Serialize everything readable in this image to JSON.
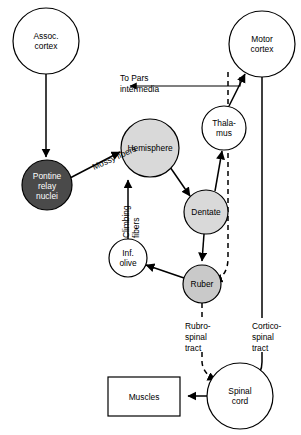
{
  "diagram": {
    "colors": {
      "white": "#ffffff",
      "light_gray": "#d9d9d9",
      "mid_gray": "#c9c9c9",
      "dark_gray": "#4a4a4a",
      "stroke": "#000000"
    },
    "nodes": [
      {
        "id": "assoc_cortex",
        "shape": "circle",
        "label": "Assoc.\ncortex",
        "lines": [
          "Assoc.",
          "cortex"
        ],
        "cx": 46,
        "cy": 41,
        "r": 33,
        "fill": "#ffffff",
        "text": "dark"
      },
      {
        "id": "motor_cortex",
        "shape": "circle",
        "label": "Motor\ncortex",
        "lines": [
          "Motor",
          "cortex"
        ],
        "cx": 262,
        "cy": 44,
        "r": 33,
        "fill": "#ffffff",
        "text": "dark"
      },
      {
        "id": "pontine",
        "shape": "circle",
        "label": "Pontine\nrelay\nnuclei",
        "lines": [
          "Pontine",
          "relay",
          "nuclei"
        ],
        "cx": 47,
        "cy": 185,
        "r": 25,
        "fill": "#4a4a4a",
        "text": "light"
      },
      {
        "id": "hemisphere",
        "shape": "circle",
        "label": "Hemisphere",
        "lines": [
          "Hemisphere"
        ],
        "cx": 150,
        "cy": 148,
        "r": 29,
        "fill": "#d9d9d9",
        "text": "dark"
      },
      {
        "id": "thalamus",
        "shape": "circle",
        "label": "Thala-\nmus",
        "lines": [
          "Thala-",
          "mus"
        ],
        "cx": 224,
        "cy": 128,
        "r": 22,
        "fill": "#ffffff",
        "text": "dark"
      },
      {
        "id": "dentate",
        "shape": "circle",
        "label": "Dentate",
        "lines": [
          "Dentate"
        ],
        "cx": 206,
        "cy": 212,
        "r": 22,
        "fill": "#d9d9d9",
        "text": "dark"
      },
      {
        "id": "inf_olive",
        "shape": "circle",
        "label": "Inf.\nolive",
        "lines": [
          "Inf.",
          "olive"
        ],
        "cx": 128,
        "cy": 258,
        "r": 19,
        "fill": "#ffffff",
        "text": "dark"
      },
      {
        "id": "ruber",
        "shape": "circle",
        "label": "Ruber",
        "lines": [
          "Ruber"
        ],
        "cx": 202,
        "cy": 284,
        "r": 19,
        "fill": "#c9c9c9",
        "text": "dark"
      },
      {
        "id": "spinal_cord",
        "shape": "circle",
        "label": "Spinal\ncord",
        "lines": [
          "Spinal",
          "cord"
        ],
        "cx": 240,
        "cy": 396,
        "r": 33,
        "fill": "#ffffff",
        "text": "dark"
      },
      {
        "id": "muscles",
        "shape": "rect",
        "label": "Muscles",
        "lines": [
          "Muscles"
        ],
        "x": 108,
        "y": 377,
        "w": 72,
        "h": 39,
        "fill": "#ffffff",
        "text": "dark"
      }
    ],
    "edge_labels": [
      {
        "id": "mossy_fibers",
        "text": "Mossy fibers",
        "x": 94,
        "y": 170,
        "rotate": -24
      },
      {
        "id": "climbing",
        "text": "Climbing",
        "x": 129,
        "y": 238,
        "rotate": -90
      },
      {
        "id": "climbing_fibers",
        "text": "fibers",
        "x": 139,
        "y": 238,
        "rotate": -90
      },
      {
        "id": "to_pars_line1",
        "text": "To Pars",
        "x": 120,
        "y": 81,
        "rotate": 0
      },
      {
        "id": "to_pars_line2",
        "text": "intermedia",
        "x": 120,
        "y": 92,
        "rotate": 0
      }
    ],
    "tracts": [
      {
        "id": "rubrospinal",
        "lines": [
          "Rubro-",
          "spinal",
          "tract"
        ],
        "x": 185,
        "y": 319,
        "style": "dashed"
      },
      {
        "id": "corticospinal",
        "lines": [
          "Cortico-",
          "spinal",
          "tract"
        ],
        "x": 252,
        "y": 319,
        "style": "solid"
      }
    ]
  }
}
